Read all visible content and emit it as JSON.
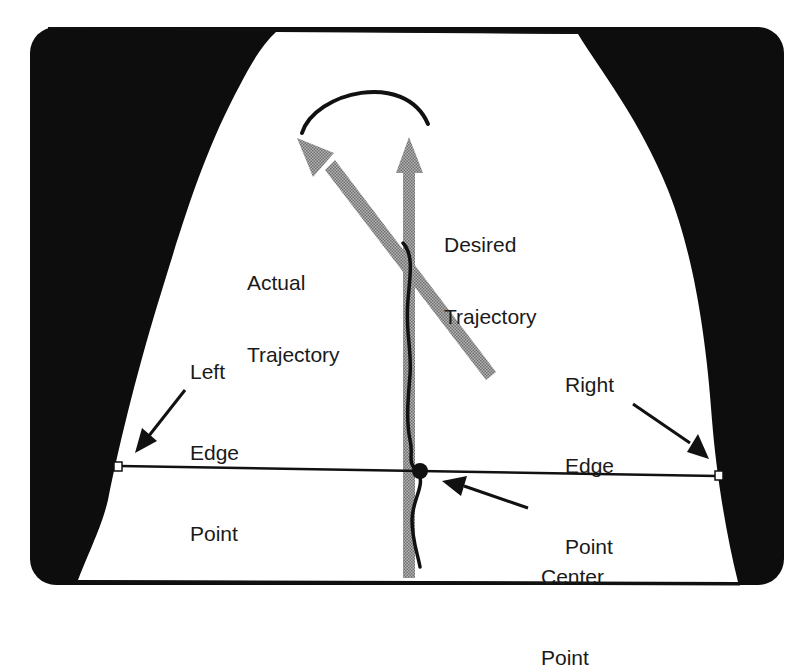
{
  "diagram": {
    "colors": {
      "background": "#ffffff",
      "frame": "#0d0d0d",
      "road": "#ffffff",
      "arrow_fill": "#9a9a9a",
      "line": "#111111"
    },
    "labels": {
      "actual_trajectory": {
        "line1": "Actual",
        "line2": "Trajectory"
      },
      "desired_trajectory": {
        "line1": "Desired",
        "line2": "Trajectory"
      },
      "left_edge_point": {
        "line1": "Left",
        "line2": "Edge",
        "line3": "Point"
      },
      "right_edge_point": {
        "line1": "Right",
        "line2": "Edge",
        "line3": "Point"
      },
      "center_point": {
        "line1": "Center",
        "line2": "Point"
      }
    }
  }
}
